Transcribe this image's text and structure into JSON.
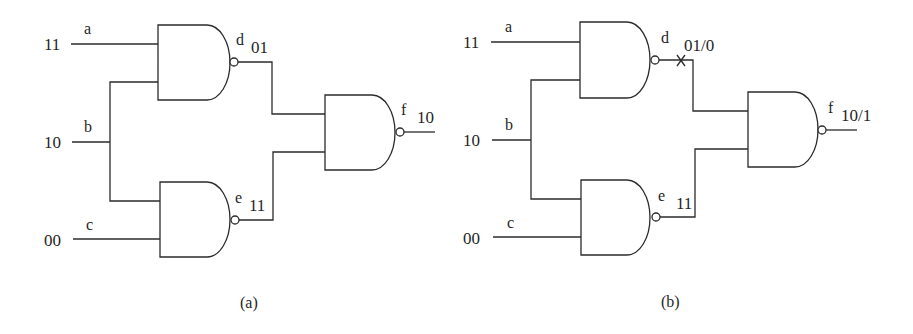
{
  "diagrams": [
    {
      "caption": "(a)",
      "inputs": [
        {
          "name": "a",
          "value": "11"
        },
        {
          "name": "b",
          "value": "10"
        },
        {
          "name": "c",
          "value": "00"
        }
      ],
      "gates": [
        {
          "name": "d",
          "type": "NAND",
          "inputs": [
            "a",
            "b"
          ],
          "value": "01"
        },
        {
          "name": "e",
          "type": "NAND",
          "inputs": [
            "b",
            "c"
          ],
          "value": "11"
        },
        {
          "name": "f",
          "type": "NAND",
          "inputs": [
            "d",
            "e"
          ],
          "value": "10"
        }
      ],
      "fault_marker": null
    },
    {
      "caption": "(b)",
      "inputs": [
        {
          "name": "a",
          "value": "11"
        },
        {
          "name": "b",
          "value": "10"
        },
        {
          "name": "c",
          "value": "00"
        }
      ],
      "gates": [
        {
          "name": "d",
          "type": "NAND",
          "inputs": [
            "a",
            "b"
          ],
          "value": "01/0"
        },
        {
          "name": "e",
          "type": "NAND",
          "inputs": [
            "b",
            "c"
          ],
          "value": "11"
        },
        {
          "name": "f",
          "type": "NAND",
          "inputs": [
            "d",
            "e"
          ],
          "value": "10/1"
        }
      ],
      "fault_marker": {
        "net": "d",
        "symbol": "×"
      }
    }
  ]
}
